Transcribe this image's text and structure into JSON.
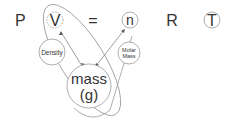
{
  "equation": {
    "P": "P",
    "V": "V",
    "equals": "=",
    "n": "n",
    "R": "R",
    "T": "T"
  },
  "nodes": {
    "density": "Density",
    "molar_mass_line1": "Molar",
    "molar_mass_line2": "Mass",
    "mass_line1": "mass",
    "mass_line2": "(g)"
  },
  "colors": {
    "stroke": "#999999",
    "text": "#333333"
  }
}
